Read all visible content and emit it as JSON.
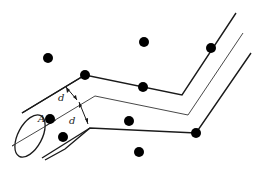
{
  "diagram": {
    "labels": {
      "point_a": "A",
      "distance_upper": "d",
      "distance_lower": "d"
    },
    "colors": {
      "stroke": "#1a1a1a",
      "dot": "#000000",
      "background": "#ffffff"
    },
    "dots": [
      {
        "x": 48,
        "y": 58
      },
      {
        "x": 144,
        "y": 42
      },
      {
        "x": 211,
        "y": 48
      },
      {
        "x": 85,
        "y": 75
      },
      {
        "x": 143,
        "y": 87
      },
      {
        "x": 50,
        "y": 119
      },
      {
        "x": 129,
        "y": 121
      },
      {
        "x": 196,
        "y": 133
      },
      {
        "x": 139,
        "y": 152
      }
    ]
  }
}
